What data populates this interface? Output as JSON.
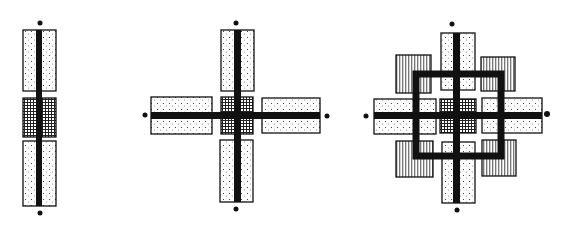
{
  "diagram": {
    "type": "architectural-plan-growth-sequence",
    "background": "#ffffff",
    "ink": "#111111",
    "stages": [
      {
        "id": "stage-1",
        "label": "linear axis",
        "arms": 2
      },
      {
        "id": "stage-2",
        "label": "cross axis",
        "arms": 4
      },
      {
        "id": "stage-3",
        "label": "cross axis with square ring",
        "arms": 4,
        "corner_blocks": 4
      }
    ],
    "legend": {
      "stippled": "stippled blocks (dotted fill)",
      "crosshatched": "center crosshatched core",
      "striped": "vertical-line hatched corner blocks"
    }
  }
}
